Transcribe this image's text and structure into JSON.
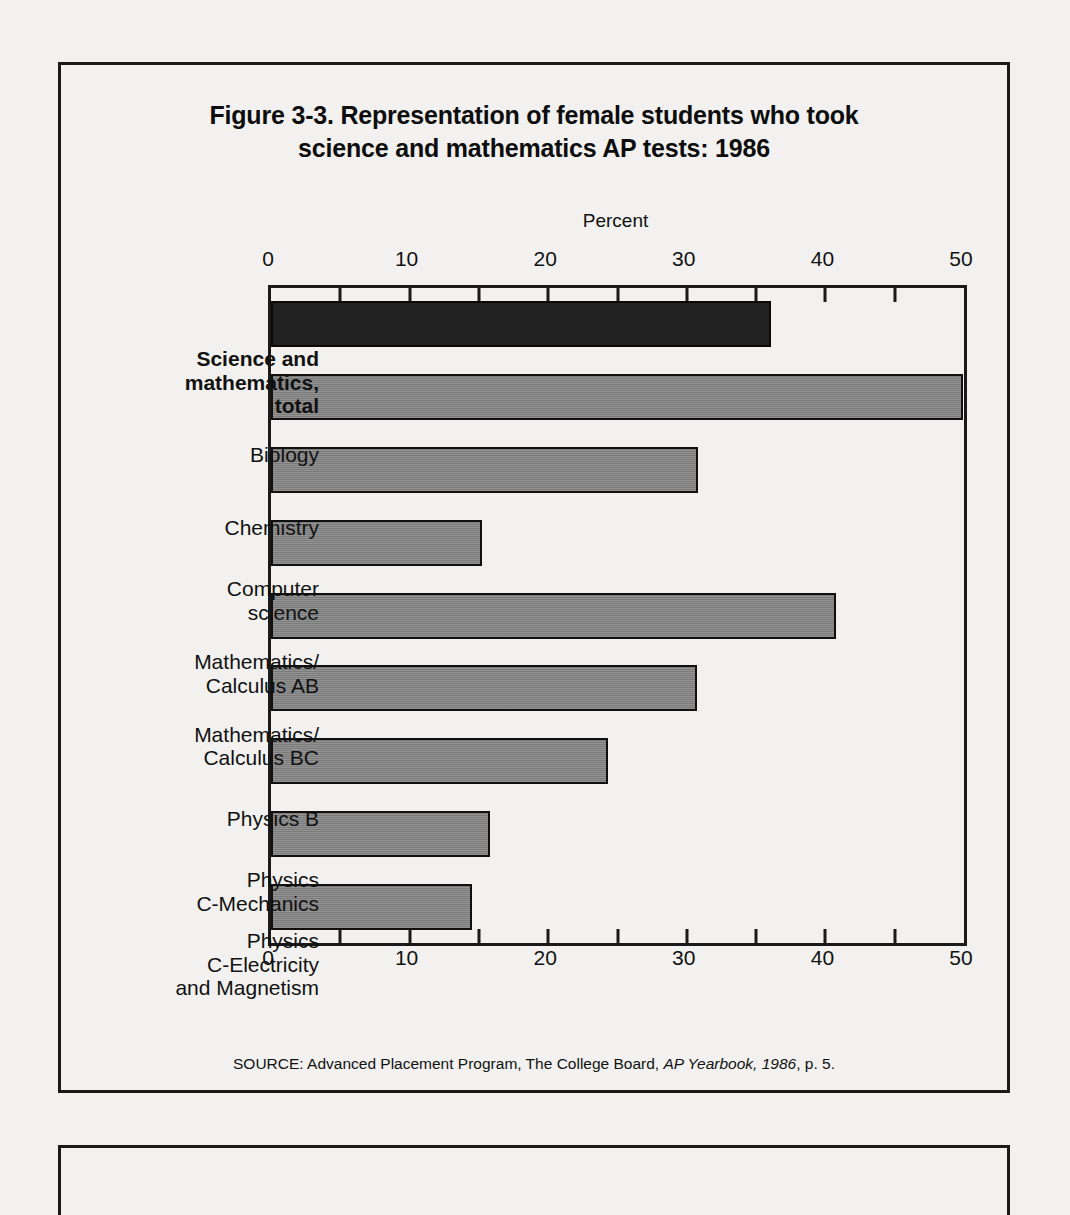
{
  "figure": {
    "title_line1": "Figure 3-3.  Representation of female students who took",
    "title_line2": "science and mathematics AP tests: 1986",
    "source_prefix": "SOURCE:  Advanced Placement Program, The College Board, ",
    "source_italic": "AP Yearbook, 1986",
    "source_suffix": ", p. 5."
  },
  "chart_data": {
    "type": "bar",
    "orientation": "horizontal",
    "title": "Figure 3-3.  Representation of female students who took science and mathematics AP tests: 1986",
    "xlabel": "Percent",
    "ylabel": "",
    "xlim": [
      0,
      50
    ],
    "xticks": [
      0,
      10,
      20,
      30,
      40,
      50
    ],
    "xtick_labels": [
      "0",
      "10",
      "20",
      "30",
      "40",
      "50"
    ],
    "minor_tick_step": 5,
    "grid": false,
    "legend": "none",
    "axis_title_position": "top-center",
    "categories": [
      "Science and mathematics, total",
      "Biology",
      "Chemistry",
      "Computer science",
      "Mathematics/ Calculus AB",
      "Mathematics/ Calculus BC",
      "Physics B",
      "Physics C-Mechanics",
      "Physics C-Electricity and Magnetism"
    ],
    "category_lines": [
      [
        "Science and",
        "mathematics,",
        "total"
      ],
      [
        "Biology"
      ],
      [
        "Chemistry"
      ],
      [
        "Computer",
        "science"
      ],
      [
        "Mathematics/",
        "Calculus AB"
      ],
      [
        "Mathematics/",
        "Calculus BC"
      ],
      [
        "Physics B"
      ],
      [
        "Physics",
        "C-Mechanics"
      ],
      [
        "Physics",
        "C-Electricity",
        "and Magnetism"
      ]
    ],
    "values": [
      36.1,
      49.9,
      30.8,
      15.2,
      40.8,
      30.7,
      24.3,
      15.8,
      14.5
    ],
    "highlight_index": 0,
    "colors": {
      "bar": "#7b7b7b",
      "bar_highlight": "#222222",
      "bar_edge": "#101010",
      "text": "#111111",
      "background": "#f2f1ef",
      "frame": "#1a1a1a"
    }
  }
}
